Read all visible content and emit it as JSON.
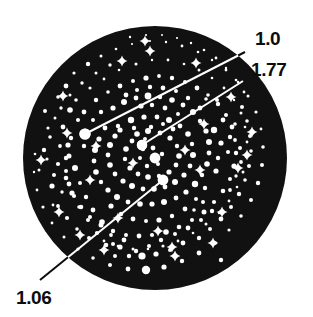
{
  "figure": {
    "type": "star-field-chart",
    "background_color": "#ffffff",
    "disc": {
      "fill_color": "#111111",
      "center_x": 155,
      "center_y": 158,
      "radius": 132
    },
    "star_color": "#ffffff",
    "leader_line_color": "#ffffff",
    "label_color": "#0d0d0d"
  },
  "annotations": [
    {
      "id": "annotation-1-0",
      "label": "1.0",
      "label_x": 255,
      "label_y": 45,
      "text_anchor": "start",
      "elbow_x": 245,
      "elbow_y": 52,
      "target_x": 85,
      "target_y": 134,
      "target_radius": 5.6
    },
    {
      "id": "annotation-1-77",
      "label": "1.77",
      "label_x": 251,
      "label_y": 76,
      "text_anchor": "start",
      "elbow_x": 243,
      "elbow_y": 81,
      "target_x": 142,
      "target_y": 145,
      "target_radius": 5.2
    },
    {
      "id": "annotation-1-06",
      "label": "1.06",
      "label_x": 16,
      "label_y": 304,
      "text_anchor": "start",
      "elbow_x": 40,
      "elbow_y": 280,
      "target_x": 163,
      "target_y": 180,
      "target_radius": 5.4
    }
  ],
  "stars": [
    [
      48,
      128,
      1.6
    ],
    [
      44,
      150,
      2.2
    ],
    [
      39,
      170,
      1.5
    ],
    [
      52,
      186,
      2.6
    ],
    [
      45,
      111,
      2.0
    ],
    [
      58,
      97,
      1.8
    ],
    [
      66,
      86,
      2.4
    ],
    [
      74,
      73,
      1.6
    ],
    [
      88,
      64,
      2.2
    ],
    [
      101,
      56,
      1.5
    ],
    [
      116,
      49,
      1.3
    ],
    [
      132,
      44,
      1.1
    ],
    [
      150,
      41,
      1.0
    ],
    [
      166,
      42,
      1.2
    ],
    [
      182,
      46,
      1.4
    ],
    [
      198,
      52,
      1.3
    ],
    [
      212,
      60,
      1.2
    ],
    [
      226,
      70,
      1.4
    ],
    [
      238,
      82,
      1.3
    ],
    [
      248,
      96,
      1.5
    ],
    [
      256,
      112,
      1.6
    ],
    [
      261,
      129,
      1.4
    ],
    [
      263,
      147,
      1.8
    ],
    [
      262,
      165,
      2.0
    ],
    [
      258,
      183,
      2.2
    ],
    [
      251,
      200,
      2.0
    ],
    [
      241,
      216,
      1.8
    ],
    [
      229,
      230,
      1.6
    ],
    [
      215,
      243,
      2.0
    ],
    [
      199,
      253,
      2.4
    ],
    [
      182,
      261,
      2.2
    ],
    [
      164,
      267,
      2.6
    ],
    [
      146,
      270,
      3.2
    ],
    [
      128,
      269,
      2.4
    ],
    [
      110,
      265,
      2.0
    ],
    [
      93,
      258,
      1.8
    ],
    [
      78,
      249,
      1.6
    ],
    [
      64,
      237,
      1.5
    ],
    [
      52,
      223,
      1.4
    ],
    [
      43,
      207,
      1.6
    ],
    [
      37,
      190,
      1.4
    ],
    [
      34,
      172,
      1.2
    ],
    [
      35,
      154,
      1.3
    ],
    [
      70,
      110,
      2.8
    ],
    [
      78,
      120,
      2.0
    ],
    [
      63,
      127,
      2.4
    ],
    [
      71,
      138,
      2.2
    ],
    [
      60,
      146,
      1.9
    ],
    [
      69,
      156,
      2.5
    ],
    [
      58,
      164,
      2.1
    ],
    [
      75,
      168,
      3.0
    ],
    [
      66,
      178,
      2.3
    ],
    [
      80,
      183,
      2.0
    ],
    [
      72,
      193,
      2.6
    ],
    [
      86,
      197,
      2.2
    ],
    [
      79,
      207,
      1.8
    ],
    [
      93,
      210,
      2.4
    ],
    [
      88,
      220,
      2.0
    ],
    [
      102,
      222,
      2.8
    ],
    [
      97,
      233,
      2.1
    ],
    [
      111,
      235,
      1.9
    ],
    [
      106,
      245,
      2.3
    ],
    [
      120,
      247,
      2.6
    ],
    [
      115,
      256,
      2.0
    ],
    [
      129,
      256,
      2.2
    ],
    [
      96,
      100,
      2.2
    ],
    [
      108,
      92,
      1.8
    ],
    [
      120,
      86,
      2.4
    ],
    [
      133,
      81,
      2.0
    ],
    [
      146,
      78,
      2.6
    ],
    [
      159,
      76,
      1.9
    ],
    [
      172,
      78,
      2.2
    ],
    [
      185,
      82,
      2.0
    ],
    [
      197,
      88,
      2.4
    ],
    [
      208,
      95,
      1.8
    ],
    [
      218,
      104,
      2.2
    ],
    [
      226,
      115,
      2.0
    ],
    [
      232,
      127,
      2.4
    ],
    [
      235,
      140,
      1.9
    ],
    [
      236,
      153,
      2.2
    ],
    [
      234,
      166,
      2.6
    ],
    [
      230,
      179,
      2.0
    ],
    [
      223,
      191,
      2.3
    ],
    [
      214,
      202,
      2.1
    ],
    [
      204,
      212,
      2.5
    ],
    [
      192,
      220,
      2.0
    ],
    [
      179,
      227,
      2.3
    ],
    [
      166,
      232,
      2.8
    ],
    [
      152,
      235,
      2.1
    ],
    [
      139,
      236,
      2.4
    ],
    [
      126,
      235,
      2.0
    ],
    [
      113,
      231,
      2.2
    ],
    [
      101,
      225,
      2.5
    ],
    [
      90,
      217,
      2.0
    ],
    [
      81,
      207,
      2.3
    ],
    [
      74,
      196,
      2.1
    ],
    [
      69,
      184,
      2.4
    ],
    [
      66,
      171,
      2.0
    ],
    [
      66,
      158,
      2.2
    ],
    [
      68,
      145,
      2.6
    ],
    [
      113,
      108,
      2.6
    ],
    [
      124,
      102,
      3.0
    ],
    [
      136,
      98,
      2.4
    ],
    [
      148,
      96,
      3.4
    ],
    [
      160,
      97,
      2.2
    ],
    [
      172,
      100,
      2.8
    ],
    [
      183,
      105,
      2.4
    ],
    [
      193,
      112,
      3.0
    ],
    [
      200,
      121,
      2.2
    ],
    [
      206,
      131,
      2.6
    ],
    [
      209,
      142,
      3.0
    ],
    [
      209,
      153,
      2.4
    ],
    [
      207,
      164,
      2.8
    ],
    [
      202,
      175,
      2.2
    ],
    [
      195,
      184,
      3.2
    ],
    [
      186,
      192,
      2.6
    ],
    [
      176,
      198,
      2.4
    ],
    [
      164,
      202,
      3.0
    ],
    [
      152,
      204,
      2.6
    ],
    [
      140,
      204,
      2.8
    ],
    [
      128,
      202,
      2.4
    ],
    [
      117,
      197,
      3.0
    ],
    [
      108,
      190,
      2.6
    ],
    [
      101,
      182,
      2.2
    ],
    [
      96,
      172,
      2.8
    ],
    [
      94,
      161,
      2.4
    ],
    [
      95,
      150,
      3.0
    ],
    [
      99,
      139,
      2.6
    ],
    [
      105,
      128,
      2.4
    ],
    [
      118,
      126,
      2.2
    ],
    [
      131,
      120,
      3.2
    ],
    [
      144,
      117,
      2.6
    ],
    [
      157,
      117,
      2.4
    ],
    [
      169,
      120,
      3.0
    ],
    [
      180,
      126,
      2.4
    ],
    [
      188,
      134,
      2.8
    ],
    [
      192,
      144,
      2.2
    ],
    [
      193,
      155,
      3.0
    ],
    [
      190,
      166,
      2.4
    ],
    [
      184,
      175,
      2.6
    ],
    [
      175,
      182,
      3.0
    ],
    [
      165,
      187,
      2.4
    ],
    [
      154,
      189,
      2.8
    ],
    [
      143,
      189,
      2.4
    ],
    [
      132,
      186,
      3.0
    ],
    [
      123,
      181,
      2.6
    ],
    [
      115,
      174,
      2.4
    ],
    [
      110,
      165,
      2.8
    ],
    [
      108,
      155,
      2.4
    ],
    [
      110,
      145,
      3.0
    ],
    [
      115,
      136,
      2.6
    ],
    [
      137,
      134,
      2.8
    ],
    [
      148,
      131,
      3.0
    ],
    [
      160,
      133,
      2.4
    ],
    [
      170,
      138,
      2.6
    ],
    [
      177,
      146,
      2.2
    ],
    [
      179,
      156,
      2.8
    ],
    [
      176,
      165,
      2.4
    ],
    [
      169,
      172,
      2.6
    ],
    [
      159,
      176,
      2.2
    ],
    [
      148,
      177,
      2.8
    ],
    [
      138,
      174,
      2.4
    ],
    [
      130,
      168,
      2.6
    ],
    [
      125,
      159,
      2.2
    ],
    [
      126,
      149,
      2.8
    ],
    [
      132,
      141,
      2.4
    ],
    [
      153,
      148,
      2.4
    ],
    [
      162,
      154,
      2.2
    ],
    [
      158,
      164,
      2.0
    ],
    [
      147,
      166,
      2.2
    ],
    [
      140,
      158,
      2.0
    ],
    [
      143,
      149,
      2.2
    ],
    [
      55,
      118,
      1.5
    ],
    [
      50,
      137,
      1.8
    ],
    [
      47,
      159,
      1.6
    ],
    [
      54,
      175,
      2.0
    ],
    [
      62,
      192,
      1.7
    ],
    [
      53,
      205,
      1.4
    ],
    [
      90,
      88,
      1.6
    ],
    [
      104,
      79,
      1.4
    ],
    [
      119,
      70,
      1.3
    ],
    [
      136,
      64,
      1.5
    ],
    [
      152,
      60,
      1.2
    ],
    [
      168,
      60,
      1.4
    ],
    [
      184,
      64,
      1.3
    ],
    [
      199,
      70,
      1.5
    ],
    [
      212,
      78,
      1.3
    ],
    [
      224,
      88,
      1.4
    ],
    [
      234,
      100,
      1.2
    ],
    [
      241,
      113,
      1.5
    ],
    [
      245,
      127,
      1.3
    ],
    [
      247,
      142,
      1.4
    ],
    [
      246,
      157,
      1.2
    ],
    [
      243,
      172,
      1.5
    ],
    [
      237,
      187,
      1.3
    ],
    [
      229,
      201,
      1.4
    ],
    [
      219,
      213,
      1.2
    ],
    [
      206,
      224,
      1.5
    ],
    [
      193,
      233,
      1.3
    ],
    [
      178,
      241,
      1.4
    ],
    [
      163,
      246,
      1.6
    ],
    [
      148,
      249,
      1.3
    ],
    [
      133,
      249,
      1.5
    ],
    [
      118,
      246,
      1.3
    ],
    [
      104,
      241,
      1.4
    ],
    [
      214,
      130,
      3.2
    ],
    [
      221,
      143,
      2.6
    ],
    [
      218,
      158,
      2.2
    ],
    [
      223,
      120,
      2.4
    ],
    [
      228,
      152,
      2.0
    ],
    [
      216,
      171,
      2.6
    ],
    [
      205,
      188,
      2.2
    ],
    [
      196,
      199,
      2.0
    ],
    [
      185,
      209,
      2.4
    ],
    [
      172,
      216,
      2.2
    ],
    [
      159,
      220,
      2.6
    ],
    [
      146,
      221,
      2.0
    ],
    [
      133,
      219,
      2.4
    ],
    [
      121,
      214,
      2.2
    ],
    [
      111,
      206,
      2.6
    ],
    [
      183,
      243,
      2.4
    ],
    [
      170,
      250,
      2.0
    ],
    [
      156,
      254,
      2.6
    ],
    [
      142,
      256,
      3.6
    ],
    [
      199,
      238,
      2.2
    ],
    [
      210,
      229,
      2.0
    ],
    [
      221,
      219,
      2.4
    ],
    [
      231,
      207,
      2.0
    ],
    [
      239,
      194,
      2.2
    ],
    [
      245,
      180,
      1.8
    ],
    [
      249,
      166,
      2.0
    ],
    [
      251,
      151,
      1.8
    ],
    [
      250,
      136,
      2.0
    ],
    [
      247,
      121,
      1.8
    ],
    [
      242,
      107,
      2.0
    ],
    [
      84,
      146,
      2.2
    ],
    [
      93,
      120,
      2.0
    ],
    [
      84,
      112,
      2.4
    ],
    [
      76,
      100,
      1.8
    ],
    [
      101,
      112,
      2.2
    ],
    [
      136,
      251,
      2.2
    ],
    [
      149,
      246,
      2.0
    ],
    [
      124,
      240,
      2.4
    ],
    [
      113,
      244,
      2.0
    ],
    [
      161,
      240,
      2.2
    ],
    [
      175,
      234,
      2.0
    ],
    [
      188,
      228,
      2.4
    ],
    [
      201,
      220,
      2.0
    ],
    [
      212,
      211,
      2.2
    ],
    [
      120,
      130,
      2.6
    ],
    [
      200,
      108,
      2.4
    ],
    [
      188,
      98,
      2.2
    ],
    [
      176,
      91,
      2.0
    ],
    [
      163,
      88,
      2.4
    ],
    [
      150,
      87,
      2.2
    ],
    [
      137,
      90,
      2.0
    ],
    [
      126,
      95,
      2.4
    ],
    [
      141,
      106,
      2.6
    ],
    [
      152,
      105,
      2.2
    ],
    [
      165,
      108,
      2.4
    ],
    [
      178,
      114,
      2.0
    ],
    [
      58,
      206,
      1.9
    ],
    [
      67,
      218,
      2.1
    ],
    [
      77,
      229,
      1.8
    ],
    [
      89,
      238,
      2.0
    ],
    [
      217,
      100,
      2.0
    ],
    [
      206,
      99,
      1.8
    ],
    [
      230,
      137,
      2.2
    ],
    [
      235,
      124,
      1.8
    ],
    [
      240,
      148,
      2.0
    ],
    [
      61,
      108,
      1.7
    ],
    [
      70,
      95,
      1.5
    ],
    [
      82,
      83,
      1.7
    ],
    [
      96,
      73,
      1.5
    ],
    [
      110,
      65,
      1.7
    ],
    [
      203,
      202,
      2.0
    ],
    [
      194,
      210,
      1.8
    ],
    [
      230,
      190,
      1.9
    ],
    [
      236,
      176,
      1.7
    ],
    [
      241,
      162,
      1.9
    ],
    [
      244,
      92,
      1.4
    ],
    [
      236,
      80,
      1.3
    ],
    [
      226,
      68,
      1.2
    ],
    [
      216,
      58,
      1.4
    ],
    [
      204,
      50,
      1.3
    ],
    [
      191,
      43,
      1.2
    ],
    [
      177,
      38,
      1.1
    ],
    [
      162,
      35,
      1.0
    ],
    [
      146,
      35,
      1.1
    ],
    [
      130,
      37,
      1.2
    ],
    [
      151,
      127,
      2.2
    ],
    [
      163,
      124,
      2.0
    ],
    [
      173,
      129,
      2.4
    ],
    [
      145,
      139,
      2.0
    ],
    [
      134,
      128,
      2.2
    ],
    [
      155,
      158,
      5.4
    ],
    [
      142,
      145,
      5.2
    ],
    [
      85,
      134,
      5.6
    ],
    [
      146,
      270,
      4.2
    ],
    [
      221,
      260,
      2.2
    ]
  ],
  "sparkles": [
    [
      150,
      51
    ],
    [
      122,
      61
    ],
    [
      196,
      63
    ],
    [
      231,
      97
    ],
    [
      247,
      155
    ],
    [
      222,
      212
    ],
    [
      175,
      256
    ],
    [
      104,
      250
    ],
    [
      59,
      212
    ],
    [
      41,
      160
    ],
    [
      63,
      96
    ],
    [
      185,
      150
    ],
    [
      133,
      163
    ],
    [
      200,
      170
    ],
    [
      158,
      231
    ],
    [
      118,
      218
    ],
    [
      96,
      146
    ],
    [
      204,
      124
    ],
    [
      252,
      132
    ],
    [
      90,
      180
    ],
    [
      172,
      247
    ],
    [
      213,
      243
    ],
    [
      67,
      133
    ],
    [
      238,
      168
    ],
    [
      145,
      41
    ],
    [
      80,
      235
    ]
  ]
}
